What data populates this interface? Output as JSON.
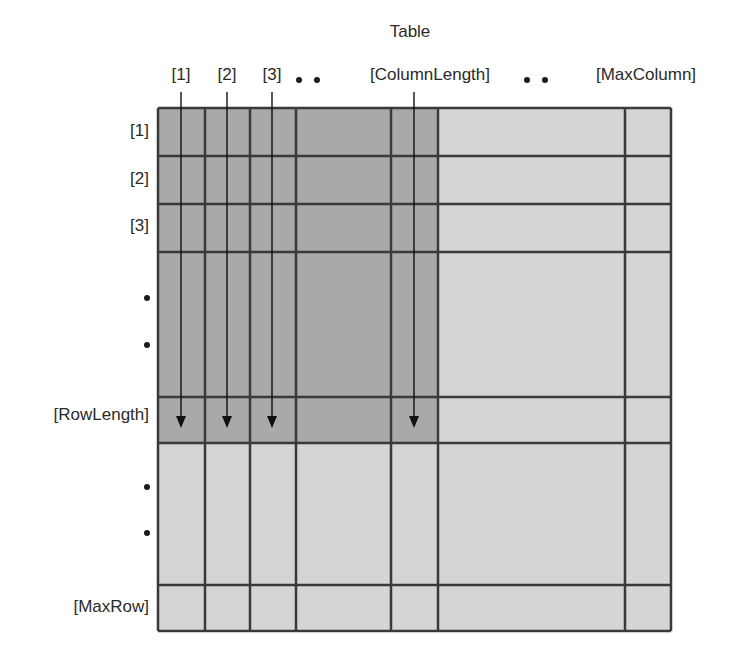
{
  "diagram": {
    "title": "Table",
    "column_labels": [
      {
        "label": "[1]",
        "x": 181
      },
      {
        "label": "[2]",
        "x": 227
      },
      {
        "label": "[3]",
        "x": 272
      },
      {
        "label": "[ColumnLength]",
        "x": 430
      },
      {
        "label": "[MaxColumn]",
        "x": 646
      }
    ],
    "column_ellipsis_dots": [
      {
        "x": 299
      },
      {
        "x": 317
      },
      {
        "x": 527
      },
      {
        "x": 545
      }
    ],
    "row_labels": [
      {
        "label": "[1]",
        "y": 131
      },
      {
        "label": "[2]",
        "y": 179
      },
      {
        "label": "[3]",
        "y": 226
      },
      {
        "label": "[RowLength]",
        "y": 415
      },
      {
        "label": "[MaxRow]",
        "y": 607
      }
    ],
    "row_ellipsis_dots": [
      {
        "y": 298
      },
      {
        "y": 345
      },
      {
        "y": 487
      },
      {
        "y": 533
      }
    ],
    "grid": {
      "column_edges": [
        158,
        205,
        250,
        296,
        391,
        438,
        625,
        671
      ],
      "row_edges": [
        108,
        156,
        204,
        252,
        397,
        443,
        585,
        631
      ],
      "used_region": {
        "x1": 158,
        "y1": 108,
        "x2": 438,
        "y2": 443
      }
    },
    "arrows": [
      {
        "x": 181,
        "y1": 92,
        "y2": 428
      },
      {
        "x": 227,
        "y1": 92,
        "y2": 428
      },
      {
        "x": 272,
        "y1": 92,
        "y2": 428
      },
      {
        "x": 414,
        "y1": 92,
        "y2": 428
      }
    ],
    "colors": {
      "used_fill": "#a9a9a9",
      "unused_fill": "#d5d5d5",
      "grid_line": "#3a3a3a",
      "arrow": "#111111",
      "text": "#2a2a2a"
    }
  }
}
